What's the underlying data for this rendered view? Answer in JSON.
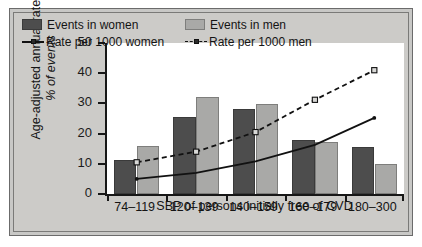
{
  "chart_data": {
    "type": "bar",
    "title": "",
    "xlabel": "SBP of persons initially free of CVD",
    "ylabel_line1": "Age-adjusted annual rate,",
    "ylabel_line2": "% of events",
    "categories": [
      "74–119",
      "120–139",
      "140–159",
      "160–179",
      "180–300"
    ],
    "ylim": [
      0,
      50
    ],
    "yticks": [
      0,
      10,
      20,
      30,
      40,
      50
    ],
    "grid": false,
    "legend_position": "top-left",
    "series": [
      {
        "name": "Events in women",
        "kind": "bar",
        "color": "#4d4d4d",
        "values": [
          11.3,
          25.6,
          28.0,
          18.0,
          15.5
        ]
      },
      {
        "name": "Events in men",
        "kind": "bar",
        "color": "#a9a9a7",
        "values": [
          16.0,
          32.0,
          29.8,
          17.1,
          10.0
        ]
      },
      {
        "name": "Rate per 1000 women",
        "kind": "line",
        "style": "solid",
        "color": "#111111",
        "values": [
          5.0,
          7.0,
          10.8,
          16.3,
          25.2
        ]
      },
      {
        "name": "Rate per 1000 men",
        "kind": "line",
        "style": "dashed",
        "marker": "square",
        "color": "#111111",
        "values": [
          10.5,
          14.0,
          20.5,
          31.2,
          41.0
        ]
      }
    ]
  },
  "legend": {
    "items": [
      {
        "label": "Events in women",
        "marker": "filled-dark-square"
      },
      {
        "label": "Events in men",
        "marker": "filled-light-square"
      },
      {
        "label": "Rate per 1000 women",
        "marker": "solid-line"
      },
      {
        "label": "Rate per 1000 men",
        "marker": "dashed-line-square"
      }
    ]
  },
  "colors": {
    "bar_women": "#4d4d4d",
    "bar_men": "#a9a9a7",
    "line": "#111111",
    "plate_background": "#cccbc8",
    "plot_background": "#ffffff",
    "axis": "#171717"
  }
}
